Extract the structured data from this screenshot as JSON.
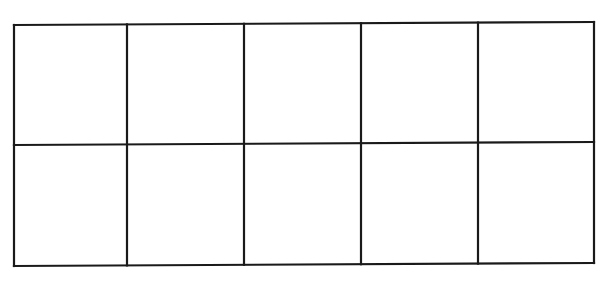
{
  "diagram": {
    "type": "ten-frame",
    "rows": 2,
    "columns": 5,
    "cells": [
      {
        "row": 1,
        "col": 1,
        "filled": false
      },
      {
        "row": 1,
        "col": 2,
        "filled": false
      },
      {
        "row": 1,
        "col": 3,
        "filled": false
      },
      {
        "row": 1,
        "col": 4,
        "filled": false
      },
      {
        "row": 1,
        "col": 5,
        "filled": false
      },
      {
        "row": 2,
        "col": 1,
        "filled": false
      },
      {
        "row": 2,
        "col": 2,
        "filled": false
      },
      {
        "row": 2,
        "col": 3,
        "filled": false
      },
      {
        "row": 2,
        "col": 4,
        "filled": false
      },
      {
        "row": 2,
        "col": 5,
        "filled": false
      }
    ],
    "line_color": "#1a1a1a",
    "background": "#ffffff"
  }
}
